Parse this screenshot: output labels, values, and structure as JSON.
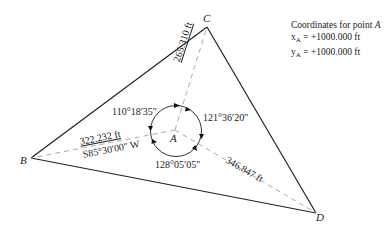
{
  "points": {
    "A": {
      "label": "A"
    },
    "B": {
      "label": "B"
    },
    "C": {
      "label": "C"
    },
    "D": {
      "label": "D"
    }
  },
  "coordinates": {
    "title_prefix": "Coordinates for point",
    "title_point": "A",
    "x_label": "x",
    "y_label": "y",
    "subscript": "A",
    "x_value": "= +1000.000 ft",
    "y_value": "= +1000.000 ft"
  },
  "distances": {
    "AC": "265.310 ft",
    "AB": "322.232 ft",
    "AB_bearing": "S85°30′00″ W",
    "AD": "346.847 ft"
  },
  "angles": {
    "BAC": "110°18′35″",
    "CAD": "121°36′20″",
    "DAB": "128°05′05″"
  },
  "colors": {
    "line": "#222222",
    "dashed": "#b0b0b0"
  }
}
